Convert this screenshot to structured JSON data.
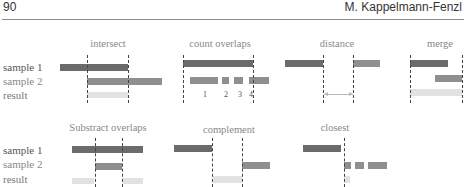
{
  "header": {
    "page_number": "90",
    "author": "M. Kappelmann-Fenzl"
  },
  "row_labels": {
    "top": [
      "sample 1",
      "sample 2",
      "result"
    ],
    "bottom": [
      "sample 1",
      "sample 2",
      "result"
    ]
  },
  "row_label_colors": {
    "sample1": "#555555",
    "sample2": "#888888",
    "result": "#777777"
  },
  "panels": {
    "intersect": {
      "title": "intersect"
    },
    "count_overlaps": {
      "title": "count overlaps",
      "counts": [
        "1",
        "2",
        "3",
        "4"
      ]
    },
    "distance": {
      "title": "distance"
    },
    "merge": {
      "title": "merge"
    },
    "subtract_overlaps": {
      "title": "Substract overlaps"
    },
    "complement": {
      "title": "complement"
    },
    "closest": {
      "title": "closest"
    }
  },
  "colors": {
    "sample1": "#6b6b6b",
    "sample2": "#8f8f8f",
    "result": "#e2e2e2"
  }
}
